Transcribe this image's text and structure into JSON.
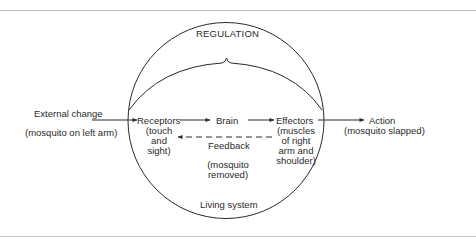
{
  "diagram": {
    "title": "REGULATION",
    "input": {
      "label": "External change",
      "detail": "(mosquito on left arm)"
    },
    "nodes": [
      {
        "id": "receptors",
        "label": "Receptors",
        "detail": "(touch\nand\nsight)"
      },
      {
        "id": "brain",
        "label": "Brain",
        "detail": ""
      },
      {
        "id": "effectors",
        "label": "Effectors",
        "detail": "(muscles\nof right\narm and\nshoulder)"
      }
    ],
    "output": {
      "label": "Action",
      "detail": "(mosquito slapped)"
    },
    "feedback": {
      "label": "Feedback",
      "detail": "(mosquito\nremoved)",
      "style": "dashed",
      "direction": "effectors-to-receptors"
    },
    "container_label": "Living system",
    "edges": [
      {
        "from": "external-change",
        "to": "receptors",
        "style": "solid"
      },
      {
        "from": "receptors",
        "to": "brain",
        "style": "solid"
      },
      {
        "from": "brain",
        "to": "effectors",
        "style": "solid"
      },
      {
        "from": "effectors",
        "to": "action",
        "style": "solid"
      },
      {
        "from": "effectors",
        "to": "receptors",
        "style": "dashed"
      }
    ],
    "colors": {
      "line": "#2a2a2a",
      "text": "#2a2a2a",
      "rule": "#b9b9b9"
    }
  }
}
